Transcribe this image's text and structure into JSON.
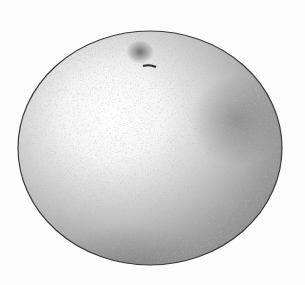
{
  "illustration": {
    "subject": "citrus fruit (grapefruit) stipple drawing",
    "style": "stipple / pointillism",
    "colors": {
      "background": "#fdfdfd",
      "outline": "#3a3a3a",
      "highlight": "#ffffff",
      "shadow": "#6e6e6e",
      "stem": "#2a2a2a"
    }
  }
}
